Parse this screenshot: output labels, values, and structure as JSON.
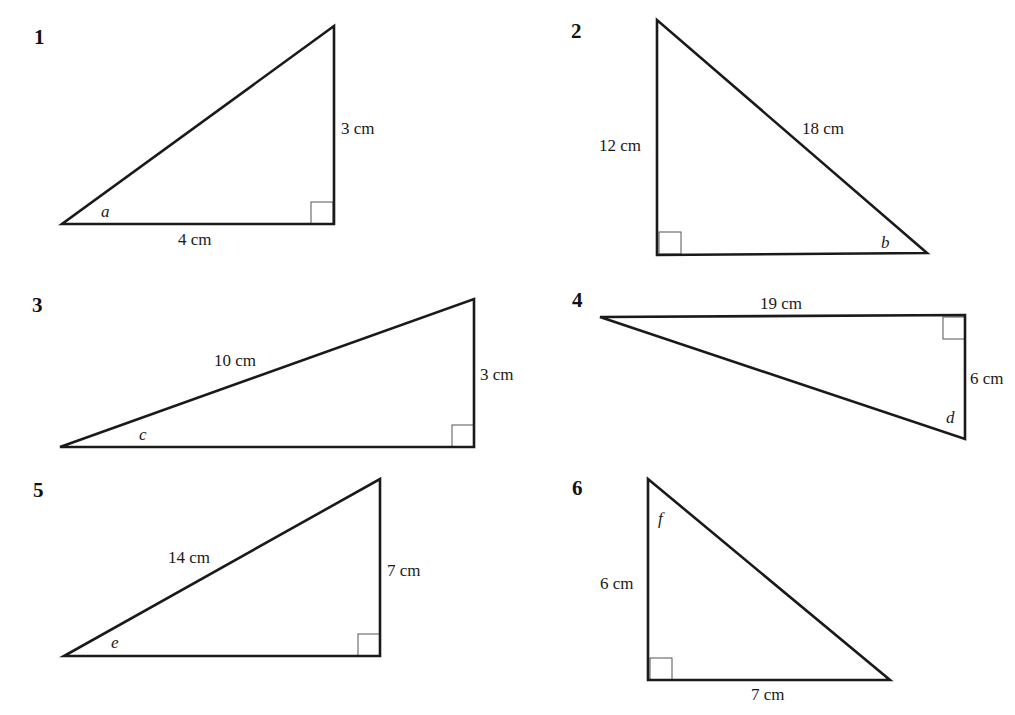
{
  "figures": [
    {
      "number": "1",
      "number_pos": [
        34,
        44
      ],
      "vertices": [
        [
          62,
          224
        ],
        [
          334,
          224
        ],
        [
          334,
          26
        ]
      ],
      "right_angle": {
        "x": 311,
        "y": 202,
        "size": 22
      },
      "labels": [
        {
          "text": "3 cm",
          "x": 341,
          "y": 134,
          "kind": "length"
        },
        {
          "text": "4 cm",
          "x": 178,
          "y": 245,
          "kind": "length"
        },
        {
          "text": "a",
          "x": 101,
          "y": 217,
          "kind": "angle"
        }
      ]
    },
    {
      "number": "2",
      "number_pos": [
        571,
        38
      ],
      "vertices": [
        [
          657,
          20
        ],
        [
          657,
          255
        ],
        [
          927,
          253
        ]
      ],
      "right_angle": {
        "x": 659,
        "y": 232,
        "size": 22
      },
      "labels": [
        {
          "text": "12 cm",
          "x": 599,
          "y": 151,
          "kind": "length"
        },
        {
          "text": "18 cm",
          "x": 802,
          "y": 134,
          "kind": "length"
        },
        {
          "text": "b",
          "x": 881,
          "y": 248,
          "kind": "angle"
        }
      ]
    },
    {
      "number": "3",
      "number_pos": [
        32,
        312
      ],
      "vertices": [
        [
          60,
          447
        ],
        [
          474,
          447
        ],
        [
          474,
          299
        ]
      ],
      "right_angle": {
        "x": 452,
        "y": 425,
        "size": 22
      },
      "labels": [
        {
          "text": "10 cm",
          "x": 214,
          "y": 366,
          "kind": "length"
        },
        {
          "text": "3 cm",
          "x": 480,
          "y": 380,
          "kind": "length"
        },
        {
          "text": "c",
          "x": 139,
          "y": 440,
          "kind": "angle"
        }
      ]
    },
    {
      "number": "4",
      "number_pos": [
        572,
        307
      ],
      "vertices": [
        [
          600,
          317
        ],
        [
          965,
          315
        ],
        [
          965,
          439
        ]
      ],
      "right_angle": {
        "x": 943,
        "y": 317,
        "size": 22
      },
      "labels": [
        {
          "text": "19 cm",
          "x": 760,
          "y": 309,
          "kind": "length"
        },
        {
          "text": "6 cm",
          "x": 970,
          "y": 384,
          "kind": "length"
        },
        {
          "text": "d",
          "x": 946,
          "y": 423,
          "kind": "angle"
        }
      ]
    },
    {
      "number": "5",
      "number_pos": [
        33,
        497
      ],
      "vertices": [
        [
          64,
          656
        ],
        [
          380,
          656
        ],
        [
          380,
          479
        ]
      ],
      "right_angle": {
        "x": 358,
        "y": 634,
        "size": 22
      },
      "labels": [
        {
          "text": "14 cm",
          "x": 168,
          "y": 563,
          "kind": "length"
        },
        {
          "text": "7 cm",
          "x": 387,
          "y": 576,
          "kind": "length"
        },
        {
          "text": "e",
          "x": 111,
          "y": 648,
          "kind": "angle"
        }
      ]
    },
    {
      "number": "6",
      "number_pos": [
        572,
        495
      ],
      "vertices": [
        [
          648,
          479
        ],
        [
          648,
          680
        ],
        [
          890,
          680
        ]
      ],
      "right_angle": {
        "x": 650,
        "y": 658,
        "size": 22
      },
      "labels": [
        {
          "text": "6 cm",
          "x": 600,
          "y": 589,
          "kind": "length"
        },
        {
          "text": "7 cm",
          "x": 751,
          "y": 700,
          "kind": "length"
        },
        {
          "text": "f",
          "x": 658,
          "y": 524,
          "kind": "angle"
        }
      ]
    }
  ]
}
